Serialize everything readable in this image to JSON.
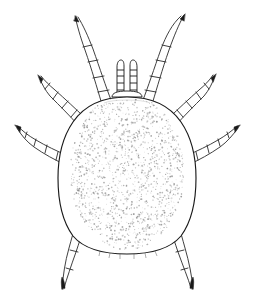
{
  "figure": {
    "domain": "Natural-Image",
    "kind": "scientific-line-drawing",
    "view": "dorsal",
    "title": "",
    "caption": "",
    "background_color": "#ffffff",
    "ink_color": "#1a1a1a",
    "stipple_color": "#8a8a8a",
    "canvas": {
      "width": 256,
      "height": 307
    }
  },
  "anatomy": {
    "idiosoma": {
      "label": "idiosoma",
      "description": "oval stippled body",
      "outline_color": "#1a1a1a",
      "fill_color": "#ffffff",
      "center_x": 127,
      "center_y": 172,
      "width": 118,
      "height": 160
    },
    "gnathosoma": {
      "label": "gnathosoma",
      "description": "mouthparts with paired palps",
      "palp_count": 2,
      "palp_segments": 5,
      "top_y": 60,
      "base_y": 97
    },
    "legs": [
      {
        "id": "leg-1-left",
        "label": "Leg I left",
        "side": "left",
        "pair": 1,
        "segments": 5,
        "tip_x": 74,
        "tip_y": 15,
        "tip_style": "pointed"
      },
      {
        "id": "leg-1-right",
        "label": "Leg I right",
        "side": "right",
        "pair": 1,
        "segments": 5,
        "tip_x": 185,
        "tip_y": 14,
        "tip_style": "arrow"
      },
      {
        "id": "leg-2-left",
        "label": "Leg II left",
        "side": "left",
        "pair": 2,
        "segments": 5,
        "tip_x": 38,
        "tip_y": 75,
        "tip_style": "arrow"
      },
      {
        "id": "leg-2-right",
        "label": "Leg II right",
        "side": "right",
        "pair": 2,
        "segments": 5,
        "tip_x": 215,
        "tip_y": 74,
        "tip_style": "arrow"
      },
      {
        "id": "leg-3-left",
        "label": "Leg III left",
        "side": "left",
        "pair": 3,
        "segments": 5,
        "tip_x": 16,
        "tip_y": 126,
        "tip_style": "arrow"
      },
      {
        "id": "leg-3-right",
        "label": "Leg III right",
        "side": "right",
        "pair": 3,
        "segments": 5,
        "tip_x": 239,
        "tip_y": 126,
        "tip_style": "arrow"
      },
      {
        "id": "leg-4-left",
        "label": "Leg IV left",
        "side": "left",
        "pair": 4,
        "segments": 5,
        "tip_x": 62,
        "tip_y": 290,
        "tip_style": "dark-claw"
      },
      {
        "id": "leg-4-right",
        "label": "Leg IV right",
        "side": "right",
        "pair": 4,
        "segments": 5,
        "tip_x": 193,
        "tip_y": 290,
        "tip_style": "dark-claw"
      }
    ],
    "leg_pair_count": 4,
    "total_leg_count": 8
  },
  "texture": {
    "stipple_label": "dorsal cuticle stippling",
    "dot_count": 1500,
    "dot_radius_min": 0.35,
    "dot_radius_max": 0.95,
    "seed": 20240517
  }
}
